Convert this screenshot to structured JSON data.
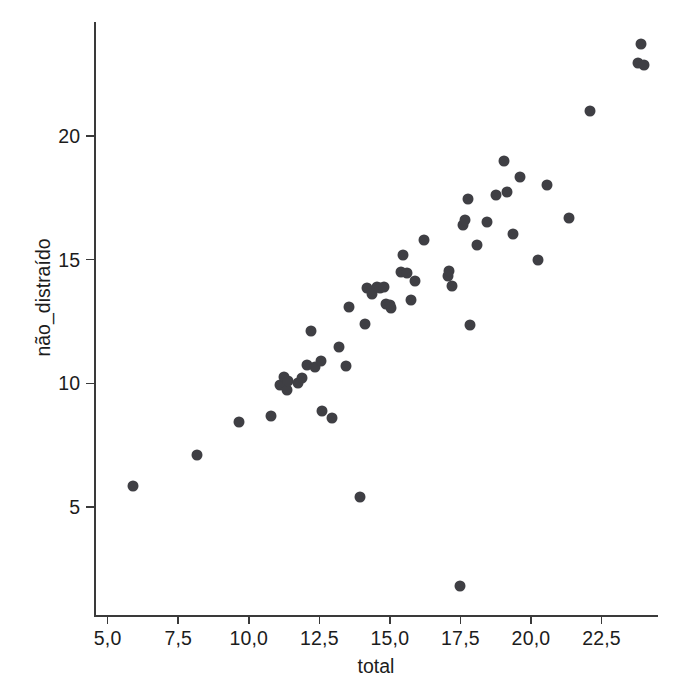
{
  "chart_data": {
    "type": "scatter",
    "title": "",
    "xlabel": "total",
    "ylabel": "não_distraído",
    "xlim": [
      4.55,
      24.5
    ],
    "ylim": [
      0.6,
      24.6
    ],
    "grid": false,
    "legend": false,
    "marker_color": "#3f3f44",
    "axis_color": "#3a3a3a",
    "background_color": "#ffffff",
    "decimal_separator": ",",
    "xticks": [
      5.0,
      7.5,
      10.0,
      12.5,
      15.0,
      17.5,
      20.0,
      22.5
    ],
    "xtick_labels": [
      "5,0",
      "7,5",
      "10,0",
      "12,5",
      "15,0",
      "17,5",
      "20,0",
      "22,5"
    ],
    "yticks": [
      5,
      10,
      15,
      20
    ],
    "ytick_labels": [
      "5",
      "10",
      "15",
      "20"
    ],
    "n_points": 55,
    "points": [
      {
        "x": 5.9,
        "y": 5.85
      },
      {
        "x": 8.15,
        "y": 7.1
      },
      {
        "x": 9.65,
        "y": 8.45
      },
      {
        "x": 10.8,
        "y": 8.7
      },
      {
        "x": 11.1,
        "y": 9.95
      },
      {
        "x": 11.25,
        "y": 10.25
      },
      {
        "x": 11.35,
        "y": 9.75
      },
      {
        "x": 11.4,
        "y": 10.1
      },
      {
        "x": 11.75,
        "y": 10.0
      },
      {
        "x": 11.9,
        "y": 10.2
      },
      {
        "x": 12.05,
        "y": 10.75
      },
      {
        "x": 12.2,
        "y": 12.1
      },
      {
        "x": 12.35,
        "y": 10.65
      },
      {
        "x": 12.55,
        "y": 10.9
      },
      {
        "x": 12.6,
        "y": 8.9
      },
      {
        "x": 12.95,
        "y": 8.6
      },
      {
        "x": 13.2,
        "y": 11.45
      },
      {
        "x": 13.45,
        "y": 10.7
      },
      {
        "x": 13.55,
        "y": 13.1
      },
      {
        "x": 13.95,
        "y": 5.4
      },
      {
        "x": 14.1,
        "y": 12.4
      },
      {
        "x": 14.2,
        "y": 13.85
      },
      {
        "x": 14.35,
        "y": 13.6
      },
      {
        "x": 14.55,
        "y": 13.9
      },
      {
        "x": 14.65,
        "y": 13.85
      },
      {
        "x": 14.8,
        "y": 13.9
      },
      {
        "x": 14.85,
        "y": 13.2
      },
      {
        "x": 15.0,
        "y": 13.15
      },
      {
        "x": 15.05,
        "y": 13.05
      },
      {
        "x": 15.4,
        "y": 14.5
      },
      {
        "x": 15.45,
        "y": 15.2
      },
      {
        "x": 15.6,
        "y": 14.45
      },
      {
        "x": 15.75,
        "y": 13.35
      },
      {
        "x": 15.9,
        "y": 14.15
      },
      {
        "x": 16.2,
        "y": 15.8
      },
      {
        "x": 17.05,
        "y": 14.35
      },
      {
        "x": 17.1,
        "y": 14.55
      },
      {
        "x": 17.2,
        "y": 13.95
      },
      {
        "x": 17.5,
        "y": 1.8
      },
      {
        "x": 17.6,
        "y": 16.4
      },
      {
        "x": 17.65,
        "y": 16.6
      },
      {
        "x": 17.75,
        "y": 17.45
      },
      {
        "x": 17.85,
        "y": 12.35
      },
      {
        "x": 18.1,
        "y": 15.6
      },
      {
        "x": 18.45,
        "y": 16.5
      },
      {
        "x": 18.75,
        "y": 17.6
      },
      {
        "x": 19.05,
        "y": 19.0
      },
      {
        "x": 19.15,
        "y": 17.75
      },
      {
        "x": 19.35,
        "y": 16.05
      },
      {
        "x": 19.6,
        "y": 18.35
      },
      {
        "x": 20.25,
        "y": 15.0
      },
      {
        "x": 20.55,
        "y": 18.0
      },
      {
        "x": 21.35,
        "y": 16.7
      },
      {
        "x": 22.1,
        "y": 21.0
      },
      {
        "x": 23.9,
        "y": 23.7
      },
      {
        "x": 23.8,
        "y": 22.95
      },
      {
        "x": 24.0,
        "y": 22.85
      }
    ]
  }
}
